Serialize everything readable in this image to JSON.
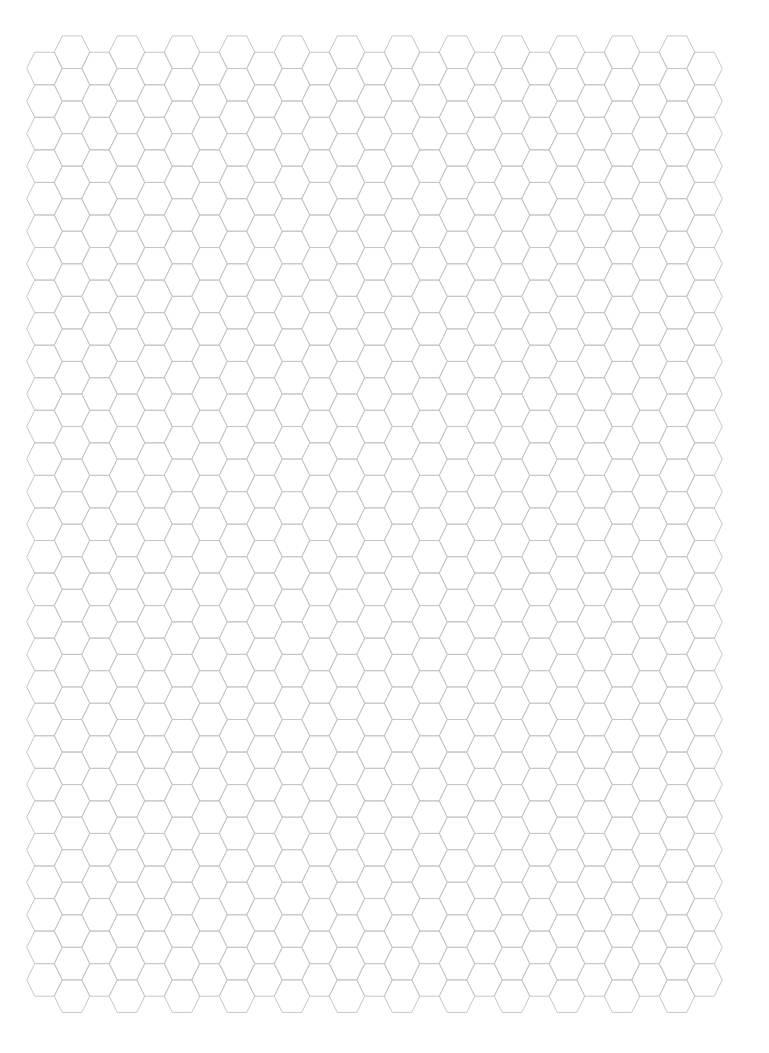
{
  "page": {
    "width": 769,
    "height": 1053,
    "background": "#ffffff"
  },
  "hex_grid": {
    "orientation": "flat-top",
    "line_color": "#c6c6c6",
    "line_width": 1,
    "half_width": 17.75,
    "half_top_edge": 9.75,
    "half_height": 16.27,
    "column_step": 27.5,
    "row_step": 32.55,
    "columns": [
      {
        "type": "low",
        "first_center_x": 44.5,
        "first_center_y": 68.5,
        "count_x": 13,
        "rows": 29
      },
      {
        "type": "high",
        "first_center_x": 72.0,
        "first_center_y": 52.2,
        "count_x": 12,
        "rows": 30
      }
    ],
    "column_pair_spacing": 55
  }
}
